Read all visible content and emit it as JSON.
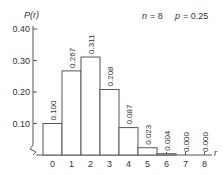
{
  "chart_data": {
    "type": "bar",
    "title": "",
    "annotation": "n = 8   p = 0.25",
    "annotation_parts": {
      "n_label": "n",
      "n_value": "= 8",
      "p_label": "p",
      "p_value": "= 0.25"
    },
    "xlabel": "r",
    "ylabel": "P(r)",
    "categories": [
      "0",
      "1",
      "2",
      "3",
      "4",
      "5",
      "6",
      "7",
      "8"
    ],
    "values": [
      0.1,
      0.267,
      0.311,
      0.208,
      0.087,
      0.023,
      0.004,
      0.0,
      0.0
    ],
    "value_labels": [
      "0.100",
      "0.267",
      "0.311",
      "0.208",
      "0.087",
      "0.023",
      "0.004",
      "0.000",
      "0.000"
    ],
    "yticks": [
      "0.10",
      "0.20",
      "0.30",
      "0.40"
    ],
    "ytick_values": [
      0.1,
      0.2,
      0.3,
      0.4
    ],
    "ylim": [
      0,
      0.4
    ],
    "grid": false,
    "legend": null,
    "axis_break_on_y": true
  }
}
